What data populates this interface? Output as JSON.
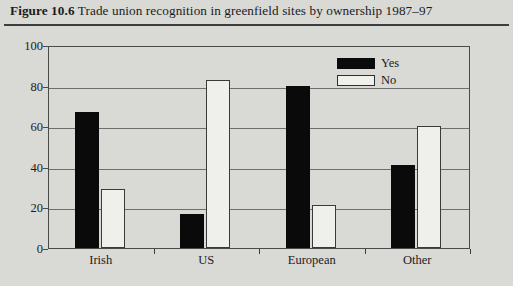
{
  "figure": {
    "number": "Figure 10.6",
    "caption": " Trade union recognition in greenfield sites by ownership 1987–97"
  },
  "chart_data": {
    "type": "bar",
    "title": "Trade union recognition in greenfield sites by ownership 1987–97",
    "xlabel": "",
    "ylabel": "",
    "ylim": [
      0,
      100
    ],
    "yticks": [
      0,
      20,
      40,
      60,
      80,
      100
    ],
    "grid": true,
    "legend_position": "top-right",
    "categories": [
      "Irish",
      "US",
      "European",
      "Other"
    ],
    "series": [
      {
        "name": "Yes",
        "color": "#0a0a0a",
        "values": [
          67,
          17,
          80,
          41
        ]
      },
      {
        "name": "No",
        "color": "#efefec",
        "values": [
          29,
          83,
          21,
          60
        ]
      }
    ]
  },
  "axis": {
    "y_tick_labels": [
      "0",
      "20",
      "40",
      "60",
      "80",
      "100"
    ],
    "x_tick_labels": [
      "Irish",
      "US",
      "European",
      "Other"
    ]
  },
  "legend": {
    "items": [
      {
        "label": "Yes"
      },
      {
        "label": "No"
      }
    ]
  }
}
